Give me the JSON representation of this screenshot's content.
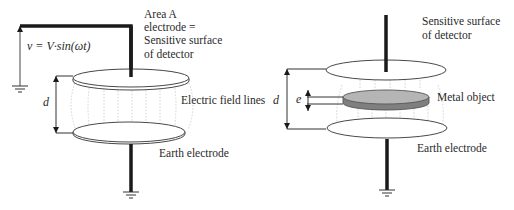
{
  "left_diagram": {
    "voltage_formula": "v = V·sin(ωt)",
    "top_electrode_label": [
      "Area A",
      "electrode =",
      "Sensitive surface",
      "of detector"
    ],
    "field_label": "Electric field lines",
    "distance_label": "d",
    "bottom_electrode_label": "Earth electrode"
  },
  "right_diagram": {
    "top_electrode_label": [
      "Sensitive surface",
      "of detector"
    ],
    "object_label": "Metal object",
    "distance_label": "d",
    "thickness_label": "e",
    "bottom_electrode_label": "Earth electrode"
  },
  "colors": {
    "line": "#1a1a1a",
    "electrode_fill": "#ffffff",
    "metal_object_fill": "#b5b5b5",
    "metal_object_edge": "#7a7a7a",
    "field_lines": "#c9c9c9"
  }
}
